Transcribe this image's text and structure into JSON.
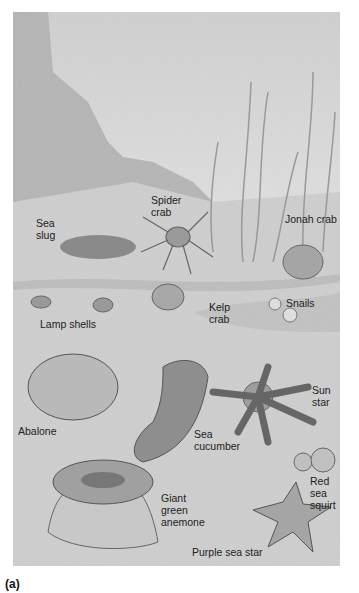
{
  "figure": {
    "panel_label": "(a)",
    "background_color": "#c9c9c9",
    "labels": [
      {
        "id": "sea-slug",
        "text": "Sea\nslug",
        "x": 36,
        "y": 217
      },
      {
        "id": "spider-crab",
        "text": "Spider\ncrab",
        "x": 151,
        "y": 194
      },
      {
        "id": "jonah-crab",
        "text": "Jonah crab",
        "x": 285,
        "y": 212
      },
      {
        "id": "lamp-shells",
        "text": "Lamp shells",
        "x": 38,
        "y": 317
      },
      {
        "id": "kelp-crab",
        "text": "Kelp\ncrab",
        "x": 209,
        "y": 301
      },
      {
        "id": "snails",
        "text": "Snails",
        "x": 286,
        "y": 296
      },
      {
        "id": "abalone",
        "text": "Abalone",
        "x": 18,
        "y": 424
      },
      {
        "id": "sun-star",
        "text": "Sun\nstar",
        "x": 312,
        "y": 383
      },
      {
        "id": "sea-cucumber",
        "text": "Sea\ncucumber",
        "x": 194,
        "y": 427
      },
      {
        "id": "red-sea-squirt",
        "text": "Red\nsea\nsquirt",
        "x": 310,
        "y": 474
      },
      {
        "id": "giant-green-anemone",
        "text": "Giant\ngreen\nanemone",
        "x": 161,
        "y": 492
      },
      {
        "id": "purple-sea-star",
        "text": "Purple sea star",
        "x": 192,
        "y": 545
      }
    ]
  }
}
